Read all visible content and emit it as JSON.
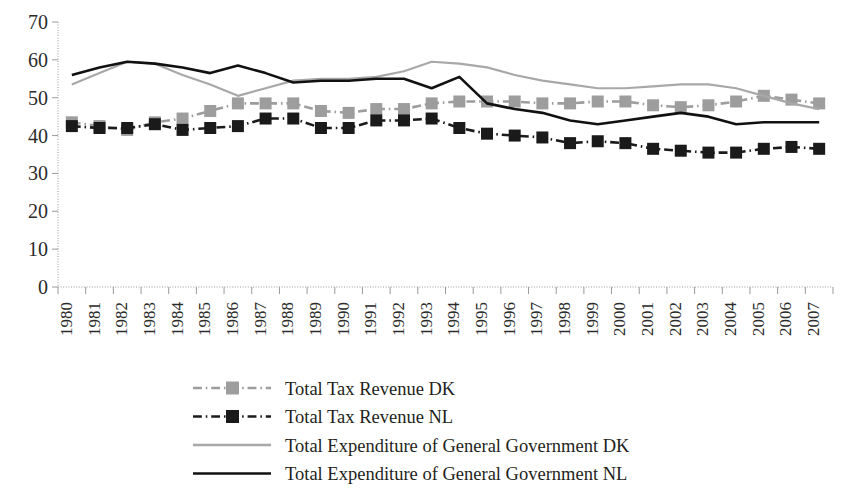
{
  "chart_data": {
    "type": "line",
    "title": "",
    "subtitle": "",
    "xlabel": "",
    "ylabel": "",
    "grid": false,
    "legend_position": "bottom",
    "ylim": [
      0,
      70
    ],
    "yticks": [
      0,
      10,
      20,
      30,
      40,
      50,
      60,
      70
    ],
    "categories": [
      "1980",
      "1981",
      "1982",
      "1983",
      "1984",
      "1985",
      "1986",
      "1987",
      "1988",
      "1989",
      "1990",
      "1991",
      "1992",
      "1993",
      "1994",
      "1995",
      "1996",
      "1997",
      "1998",
      "1999",
      "2000",
      "2001",
      "2002",
      "2003",
      "2004",
      "2005",
      "2006",
      "2007"
    ],
    "series": [
      {
        "name": "Total Tax Revenue DK",
        "color": "#9d9d9d",
        "marker": "square",
        "line_style": "dash-dot",
        "values": [
          43.5,
          42.5,
          41.5,
          43.5,
          44.5,
          46.5,
          48.5,
          48.5,
          48.5,
          46.5,
          46.0,
          47.0,
          47.0,
          48.5,
          49.0,
          49.0,
          49.0,
          48.5,
          48.5,
          49.0,
          49.0,
          48.0,
          47.5,
          48.0,
          49.0,
          50.5,
          49.5,
          48.5
        ]
      },
      {
        "name": "Total Tax Revenue NL",
        "color": "#1a1a1a",
        "marker": "square",
        "line_style": "dash-dot",
        "values": [
          42.5,
          42.0,
          42.0,
          43.0,
          41.5,
          42.0,
          42.5,
          44.5,
          44.5,
          42.0,
          42.0,
          44.0,
          44.0,
          44.5,
          42.0,
          40.5,
          40.0,
          39.5,
          38.0,
          38.5,
          38.0,
          36.5,
          36.0,
          35.5,
          35.5,
          36.5,
          37.0,
          36.5
        ]
      },
      {
        "name": "Total Expenditure of General Government DK",
        "color": "#a8a8a8",
        "marker": "none",
        "line_style": "solid",
        "values": [
          53.5,
          56.5,
          59.5,
          59.0,
          56.0,
          53.5,
          50.5,
          52.5,
          54.5,
          55.0,
          55.0,
          55.5,
          57.0,
          59.5,
          59.0,
          58.0,
          56.0,
          54.5,
          53.5,
          52.5,
          52.5,
          53.0,
          53.5,
          53.5,
          52.5,
          50.5,
          48.5,
          47.0
        ]
      },
      {
        "name": "Total Expenditure of General Government NL",
        "color": "#111111",
        "marker": "none",
        "line_style": "solid",
        "values": [
          56.0,
          58.0,
          59.5,
          59.0,
          58.0,
          56.5,
          58.5,
          56.5,
          54.0,
          54.5,
          54.5,
          55.0,
          55.0,
          52.5,
          55.5,
          48.5,
          47.0,
          46.0,
          44.0,
          43.0,
          44.0,
          45.0,
          46.0,
          45.0,
          43.0,
          43.5,
          43.5,
          43.5
        ]
      }
    ]
  },
  "legend": {
    "items": [
      {
        "label": "Total Tax Revenue DK"
      },
      {
        "label": "Total Tax Revenue NL"
      },
      {
        "label": "Total Expenditure of General Government DK"
      },
      {
        "label": "Total Expenditure of General Government NL"
      }
    ]
  }
}
